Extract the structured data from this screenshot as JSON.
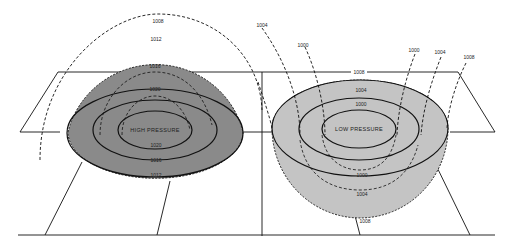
{
  "diagram": {
    "colors": {
      "high_fill": "#8a8a8a",
      "low_fill": "#c4c4c4",
      "line": "#111111",
      "background": "#ffffff"
    },
    "high": {
      "label": "HIGH PRESSURE",
      "dome_labels": {
        "outer": "1008",
        "dome_top": "1012",
        "inner1": "1016",
        "inner2": "1020"
      },
      "surface_labels": {
        "center": "1020",
        "middle": "1016",
        "outer": "1012"
      }
    },
    "low": {
      "label": "LOW PRESSURE",
      "surface_labels": {
        "outer": "1004",
        "inner": "1000"
      },
      "plane_label": "1008",
      "bowl_labels": {
        "b1000": "1000",
        "b1004": "1004",
        "b1008": "1008"
      },
      "arc_labels": {
        "left_1004": "1004",
        "left_1000": "1000",
        "right_1000": "1000",
        "right_1004": "1004",
        "right_1008": "1008"
      }
    }
  }
}
